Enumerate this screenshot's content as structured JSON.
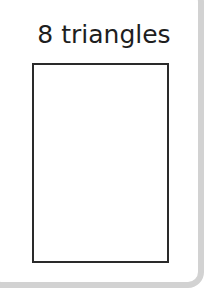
{
  "card": {
    "title": "8 triangles",
    "colors": {
      "background": "#ffffff",
      "border": "#d2d2d2",
      "text": "#1e1e1e",
      "shape_outline": "#2a2a2a"
    }
  }
}
